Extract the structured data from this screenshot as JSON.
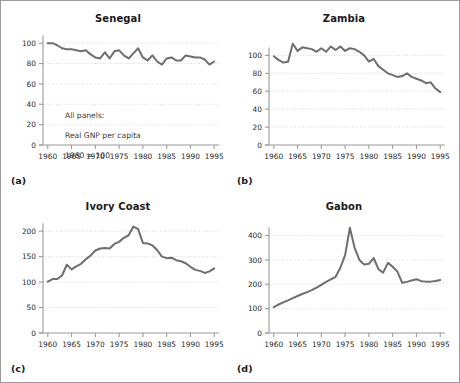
{
  "figure": {
    "note_line1": "All panels:",
    "note_line2": "Real GNP per capita",
    "note_line3": "1960 = 100",
    "line_color": "#6e6e6e",
    "grid_color": "#cfcfcf",
    "axis_color": "#9a9a9a",
    "border_color": "#9a9a9a",
    "background": "#ffffff"
  },
  "panels": [
    {
      "letter": "(a)",
      "title": "Senegal"
    },
    {
      "letter": "(b)",
      "title": "Zambia"
    },
    {
      "letter": "(c)",
      "title": "Ivory Coast"
    },
    {
      "letter": "(d)",
      "title": "Gabon"
    }
  ],
  "chart_data": [
    {
      "type": "line",
      "title": "Senegal",
      "panel": "(a)",
      "xlabel": "",
      "ylabel": "",
      "xlim": [
        1959,
        1996
      ],
      "ylim": [
        0,
        110
      ],
      "xticks": [
        1960,
        1965,
        1970,
        1975,
        1980,
        1985,
        1990,
        1995
      ],
      "yticks": [
        0,
        20,
        40,
        60,
        80,
        100
      ],
      "grid": true,
      "legend": "none",
      "annotation": "All panels:\nReal GNP per capita\n1960 = 100",
      "x": [
        1960,
        1961,
        1962,
        1963,
        1964,
        1965,
        1966,
        1967,
        1968,
        1969,
        1970,
        1971,
        1972,
        1973,
        1974,
        1975,
        1976,
        1977,
        1978,
        1979,
        1980,
        1981,
        1982,
        1983,
        1984,
        1985,
        1986,
        1987,
        1988,
        1989,
        1990,
        1991,
        1992,
        1993,
        1994,
        1995
      ],
      "values": [
        100,
        100,
        98,
        95,
        94,
        94,
        93,
        92,
        93,
        89,
        86,
        85,
        91,
        85,
        92,
        93,
        88,
        85,
        90,
        95,
        86,
        83,
        88,
        82,
        79,
        85,
        86,
        83,
        83,
        88,
        87,
        86,
        86,
        84,
        79,
        82
      ]
    },
    {
      "type": "line",
      "title": "Zambia",
      "panel": "(b)",
      "xlabel": "",
      "ylabel": "",
      "xlim": [
        1959,
        1996
      ],
      "ylim": [
        0,
        125
      ],
      "xticks": [
        1960,
        1965,
        1970,
        1975,
        1980,
        1985,
        1990,
        1995
      ],
      "yticks": [
        0,
        20,
        40,
        60,
        80,
        100
      ],
      "grid": true,
      "legend": "none",
      "x": [
        1960,
        1961,
        1962,
        1963,
        1964,
        1965,
        1966,
        1967,
        1968,
        1969,
        1970,
        1971,
        1972,
        1973,
        1974,
        1975,
        1976,
        1977,
        1978,
        1979,
        1980,
        1981,
        1982,
        1983,
        1984,
        1985,
        1986,
        1987,
        1988,
        1989,
        1990,
        1991,
        1992,
        1993,
        1994,
        1995
      ],
      "values": [
        99,
        95,
        92,
        93,
        113,
        105,
        109,
        108,
        107,
        104,
        108,
        104,
        110,
        106,
        110,
        105,
        108,
        107,
        104,
        100,
        93,
        96,
        88,
        84,
        80,
        78,
        76,
        77,
        80,
        76,
        74,
        72,
        69,
        70,
        63,
        59
      ]
    },
    {
      "type": "line",
      "title": "Ivory Coast",
      "panel": "(c)",
      "xlabel": "",
      "ylabel": "",
      "xlim": [
        1959,
        1996
      ],
      "ylim": [
        0,
        220
      ],
      "xticks": [
        1960,
        1965,
        1970,
        1975,
        1980,
        1985,
        1990,
        1995
      ],
      "yticks": [
        0,
        50,
        100,
        150,
        200
      ],
      "grid": true,
      "legend": "none",
      "x": [
        1960,
        1961,
        1962,
        1963,
        1964,
        1965,
        1966,
        1967,
        1968,
        1969,
        1970,
        1971,
        1972,
        1973,
        1974,
        1975,
        1976,
        1977,
        1978,
        1979,
        1980,
        1981,
        1982,
        1983,
        1984,
        1985,
        1986,
        1987,
        1988,
        1989,
        1990,
        1991,
        1992,
        1993,
        1994,
        1995
      ],
      "values": [
        101,
        106,
        106,
        113,
        134,
        125,
        131,
        136,
        145,
        152,
        162,
        166,
        167,
        166,
        175,
        179,
        187,
        192,
        209,
        204,
        177,
        176,
        172,
        163,
        150,
        147,
        148,
        143,
        141,
        137,
        130,
        124,
        122,
        118,
        121,
        127
      ]
    },
    {
      "type": "line",
      "title": "Gabon",
      "panel": "(d)",
      "xlabel": "",
      "ylabel": "",
      "xlim": [
        1959,
        1996
      ],
      "ylim": [
        0,
        460
      ],
      "xticks": [
        1960,
        1965,
        1970,
        1975,
        1980,
        1985,
        1990,
        1995
      ],
      "yticks": [
        0,
        100,
        200,
        300,
        400
      ],
      "grid": true,
      "legend": "none",
      "x": [
        1960,
        1961,
        1962,
        1963,
        1964,
        1965,
        1966,
        1967,
        1968,
        1969,
        1970,
        1971,
        1972,
        1973,
        1974,
        1975,
        1976,
        1977,
        1978,
        1979,
        1980,
        1981,
        1982,
        1983,
        1984,
        1985,
        1986,
        1987,
        1988,
        1989,
        1990,
        1991,
        1992,
        1993,
        1994,
        1995
      ],
      "values": [
        106,
        117,
        126,
        134,
        143,
        152,
        160,
        168,
        176,
        186,
        198,
        210,
        220,
        231,
        268,
        320,
        432,
        350,
        300,
        281,
        284,
        308,
        262,
        248,
        288,
        272,
        252,
        206,
        210,
        216,
        221,
        213,
        211,
        211,
        214,
        218
      ]
    }
  ]
}
